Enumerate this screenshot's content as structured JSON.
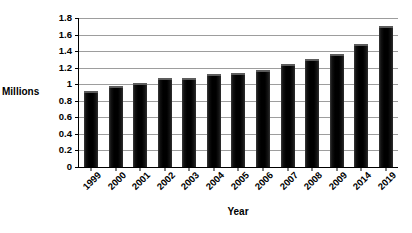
{
  "chart_data": {
    "type": "bar",
    "title": "",
    "xlabel": "Year",
    "ylabel": "Millions",
    "categories": [
      "1999",
      "2000",
      "2001",
      "2002",
      "2003",
      "2004",
      "2005",
      "2006",
      "2007",
      "2008",
      "2009",
      "2014",
      "2019"
    ],
    "values": [
      0.92,
      0.98,
      1.02,
      1.08,
      1.08,
      1.12,
      1.14,
      1.17,
      1.24,
      1.3,
      1.36,
      1.49,
      1.7
    ],
    "ylim": [
      0,
      1.8
    ],
    "ytick_labels": [
      "1.8",
      "1.6",
      "1.4",
      "1.2",
      "1",
      "0.8",
      "0.6",
      "0.4",
      "0.2",
      "0"
    ],
    "ytick_values": [
      1.8,
      1.6,
      1.4,
      1.2,
      1.0,
      0.8,
      0.6,
      0.4,
      0.2,
      0
    ],
    "grid": true,
    "legend": false,
    "legend_position": "none",
    "bar_color": "#000000",
    "gridline_color": "#9d9d9d",
    "axis_color": "#000000"
  }
}
